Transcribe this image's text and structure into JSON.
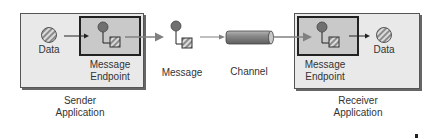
{
  "diagram": {
    "sender": {
      "data_label": "Data",
      "endpoint_label_1": "Message",
      "endpoint_label_2": "Endpoint",
      "app_label_1": "Sender",
      "app_label_2": "Application"
    },
    "message_label": "Message",
    "channel_label": "Channel",
    "receiver": {
      "data_label": "Data",
      "endpoint_label_1": "Message",
      "endpoint_label_2": "Endpoint",
      "app_label_1": "Receiver",
      "app_label_2": "Application"
    },
    "colors": {
      "app_fill": "#e9e9e9",
      "endpoint_fill": "#c9c9c9",
      "circle_fill": "#707070",
      "arrow": "#808080",
      "pipe": "#8a8a8a"
    }
  }
}
